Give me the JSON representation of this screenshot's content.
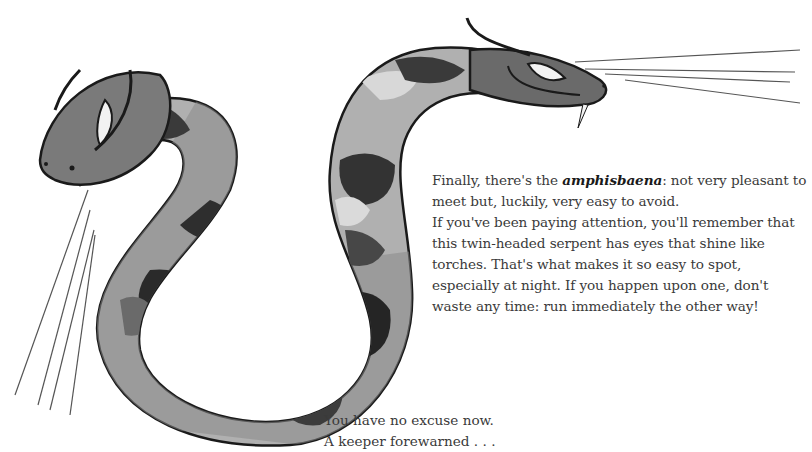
{
  "illustration": {
    "subject": "two-headed-serpent-amphisbaena",
    "palette": {
      "outline": "#1a1a1a",
      "dark": "#2a2a2a",
      "mid": "#6e6e6e",
      "light": "#b8b8b8",
      "pale": "#dcdcdc",
      "eye": "#f2f2f2"
    }
  },
  "body_text": {
    "p1_before": "Finally, there's the ",
    "p1_term": "amphisbaena",
    "p1_after": ": not very pleasant to meet but, luckily, very easy to avoid.",
    "p2": "If you've been paying attention, you'll remember that this twin-headed serpent has eyes that shine like torches. That's what makes it so easy to spot, especially at night. If you happen upon one, don't waste any time: run immediately the other way!"
  },
  "closing_text": {
    "line1": "You have no excuse now.",
    "line2": "A keeper forewarned . . ."
  }
}
